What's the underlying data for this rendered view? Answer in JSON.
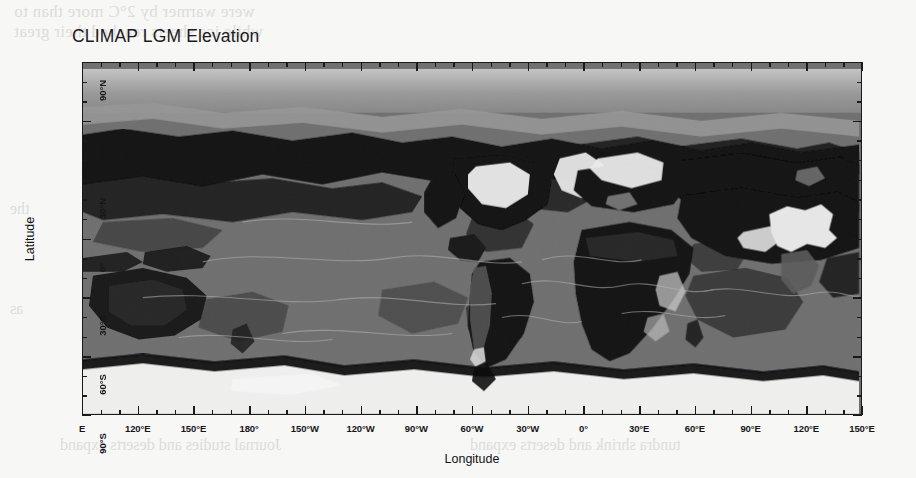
{
  "figure": {
    "title": "CLIMAP LGM Elevation",
    "background_color": "#f7f7f6",
    "frame_color": "#1a1a1a"
  },
  "axes": {
    "x": {
      "title": "Longitude",
      "tick_labels": [
        "E",
        "120°E",
        "150°E",
        "180°",
        "150°W",
        "120°W",
        "90°W",
        "60°W",
        "30°W",
        "0°",
        "30°E",
        "60°E",
        "90°E",
        "120°E",
        "150°E"
      ],
      "minor_ticks_per_interval": 2
    },
    "y": {
      "title": "Latitude",
      "tick_labels": [
        "90°N",
        "60°N",
        "30°N",
        "0°",
        "30°S",
        "60°S",
        "90°S"
      ],
      "minor_ticks_per_interval": 2
    }
  },
  "chart_data": {
    "type": "heatmap",
    "title": "CLIMAP LGM Elevation",
    "xlabel": "Longitude",
    "ylabel": "Latitude",
    "xlim": [
      90,
      450
    ],
    "ylim": [
      -90,
      90
    ],
    "grid": false,
    "legend": "none",
    "projection": "equirectangular, Pacific-centered (90°E – 170°E wrapped)",
    "x_tick_values": [
      90,
      120,
      150,
      180,
      210,
      240,
      270,
      300,
      330,
      360,
      390,
      420,
      450
    ],
    "x_tick_labels": [
      "E",
      "120°E",
      "150°E",
      "180°",
      "150°W",
      "120°W",
      "90°W",
      "60°W",
      "30°W",
      "0°",
      "30°E",
      "60°E",
      "90°E",
      "120°E",
      "150°E"
    ],
    "y_tick_values": [
      90,
      60,
      30,
      0,
      -30,
      -60,
      -90
    ],
    "y_tick_labels": [
      "90°N",
      "60°N",
      "30°N",
      "0°",
      "30°S",
      "60°S",
      "90°S"
    ],
    "colormap": "grayscale",
    "colormap_note": "Darkest gray = lowest elevation / deep ocean basins; lightest = highest elevation / continental ice sheets",
    "value_classes": [
      {
        "label": "deep ocean basin",
        "gray": "#111111"
      },
      {
        "label": "ocean / shelf",
        "gray": "#6e6e6e"
      },
      {
        "label": "low land",
        "gray": "#8c8c8c"
      },
      {
        "label": "upland",
        "gray": "#b4b4b4"
      },
      {
        "label": "high plateau / ice sheet",
        "gray": "#f2f2f2"
      }
    ]
  }
}
